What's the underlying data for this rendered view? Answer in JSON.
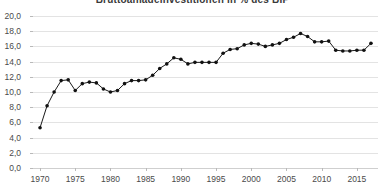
{
  "chart": {
    "title": "Bruttoanlageinvestitionen in % des BIP",
    "background_color": "#ffffff",
    "line_color": "#1a1a1a",
    "marker_color": "#111111",
    "grid_color": "#e3e3e3",
    "axis_color": "#cfcfcf",
    "tick_text_color": "#4a4a4a"
  },
  "chart_data": {
    "type": "line",
    "title": "Bruttoanlageinvestitionen in % des BIP",
    "subtitle": "",
    "xlabel": "",
    "ylabel": "",
    "xlim": [
      1969,
      2018
    ],
    "ylim": [
      0,
      20
    ],
    "grid": "horizontal",
    "legend": "none",
    "decimal_separator": ",",
    "ytick_labels": [
      "0,0",
      "2,0",
      "4,0",
      "6,0",
      "8,0",
      "10,0",
      "12,0",
      "14,0",
      "16,0",
      "18,0",
      "20,0"
    ],
    "ytick_values": [
      0,
      2,
      4,
      6,
      8,
      10,
      12,
      14,
      16,
      18,
      20
    ],
    "xtick_labels": [
      "1970",
      "1975",
      "1980",
      "1985",
      "1990",
      "1995",
      "2000",
      "2005",
      "2010",
      "2015"
    ],
    "xtick_values": [
      1970,
      1975,
      1980,
      1985,
      1990,
      1995,
      2000,
      2005,
      2010,
      2015
    ],
    "series": [
      {
        "name": "Anteil",
        "marker": "circle",
        "x": [
          1970,
          1971,
          1972,
          1973,
          1974,
          1975,
          1976,
          1977,
          1978,
          1979,
          1980,
          1981,
          1982,
          1983,
          1984,
          1985,
          1986,
          1987,
          1988,
          1989,
          1990,
          1991,
          1992,
          1993,
          1994,
          1995,
          1996,
          1997,
          1998,
          1999,
          2000,
          2001,
          2002,
          2003,
          2004,
          2005,
          2006,
          2007,
          2008,
          2009,
          2010,
          2011,
          2012,
          2013,
          2014,
          2015,
          2016,
          2017
        ],
        "values": [
          5.3,
          8.2,
          10.0,
          11.5,
          11.6,
          10.2,
          11.1,
          11.3,
          11.2,
          10.4,
          10.0,
          10.2,
          11.1,
          11.5,
          11.5,
          11.6,
          12.2,
          13.1,
          13.7,
          14.5,
          14.3,
          13.7,
          13.9,
          13.9,
          13.9,
          13.9,
          15.1,
          15.6,
          15.7,
          16.2,
          16.4,
          16.3,
          16.0,
          16.2,
          16.4,
          16.9,
          17.2,
          17.7,
          17.3,
          16.6,
          16.6,
          16.7,
          15.5,
          15.4,
          15.4,
          15.5,
          15.5,
          16.4
        ]
      }
    ]
  }
}
